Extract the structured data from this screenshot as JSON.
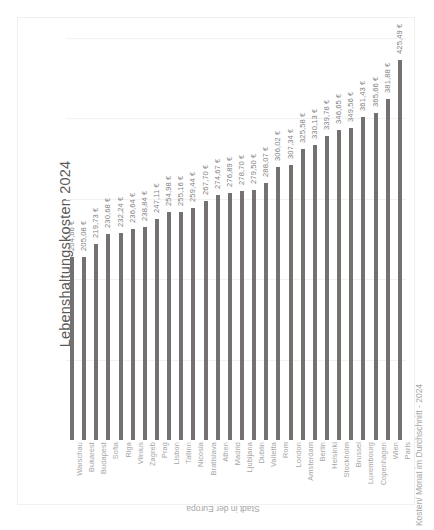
{
  "chart_data": {
    "type": "bar",
    "title": "Lebenshaltungskosten 2024",
    "xlabel": "Stadt in der Europa",
    "ylabel": "Kosten/ Monat im Durchschnitt - 2024",
    "ylim": [
      0,
      450
    ],
    "grid": true,
    "legend": "none",
    "orientation": "vertical-bars-rotated-labels",
    "currency_suffix": "€",
    "categories": [
      "Warschau",
      "Bukarest",
      "Budapest",
      "Sofia",
      "Riga",
      "Vilnius",
      "Zagreb",
      "Prag",
      "Lisbon",
      "Tallinn",
      "Nicosia",
      "Bratislava",
      "Athen",
      "Madrid",
      "Ljubljana",
      "Dublin",
      "Valletta",
      "Rom",
      "London",
      "Amsterdam",
      "Berlin",
      "Helsinki",
      "Stockholm",
      "Brussel",
      "Luxembourg",
      "Copenhagen",
      "Wien",
      "Paris"
    ],
    "values": [
      204.66,
      205.08,
      219.73,
      230.68,
      232.24,
      236.64,
      238.84,
      247.11,
      254.98,
      255.16,
      259.44,
      267.7,
      274.67,
      276.89,
      278.7,
      279.5,
      288.07,
      306.02,
      307.34,
      325.58,
      330.13,
      339.78,
      346.65,
      349.56,
      361.43,
      365.66,
      381.88,
      425.49
    ],
    "value_labels": [
      "204,66 €",
      "205,08 €",
      "219,73 €",
      "230,68 €",
      "232,24 €",
      "236,64 €",
      "238,84 €",
      "247,11 €",
      "254,98 €",
      "255,16 €",
      "259,44 €",
      "267,70 €",
      "274,67 €",
      "276,89 €",
      "278,70 €",
      "279,50 €",
      "288,07 €",
      "306,02 €",
      "307,34 €",
      "325,58 €",
      "330,13 €",
      "339,78 €",
      "346,65 €",
      "349,56 €",
      "361,43 €",
      "365,66 €",
      "381,88 €",
      "425,49 €"
    ],
    "gridline_values": [
      90,
      180,
      270,
      360,
      450
    ],
    "colors": {
      "bar": "#767171",
      "gridline": "#f2f2f2",
      "title_text": "#595959",
      "label_text": "#7f7f7f",
      "axis_title_text": "#a6a6a6",
      "background": "#ffffff",
      "frame": "#f0f0f0"
    }
  }
}
